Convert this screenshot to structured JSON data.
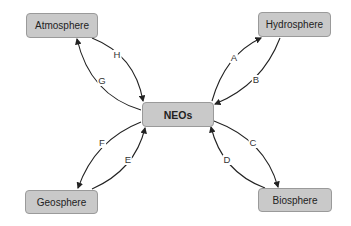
{
  "diagram": {
    "center": {
      "label": "NEOs"
    },
    "nodes": [
      {
        "id": "atmosphere",
        "label": "Atmosphere"
      },
      {
        "id": "hydrosphere",
        "label": "Hydrosphere"
      },
      {
        "id": "geosphere",
        "label": "Geosphere"
      },
      {
        "id": "biosphere",
        "label": "Biosphere"
      }
    ],
    "edges": [
      {
        "label": "A",
        "from": "NEOs",
        "to": "Hydrosphere"
      },
      {
        "label": "B",
        "from": "Hydrosphere",
        "to": "NEOs"
      },
      {
        "label": "C",
        "from": "NEOs",
        "to": "Biosphere"
      },
      {
        "label": "D",
        "from": "Biosphere",
        "to": "NEOs"
      },
      {
        "label": "E",
        "from": "Geosphere",
        "to": "NEOs"
      },
      {
        "label": "F",
        "from": "NEOs",
        "to": "Geosphere"
      },
      {
        "label": "G",
        "from": "NEOs",
        "to": "Atmosphere"
      },
      {
        "label": "H",
        "from": "Atmosphere",
        "to": "NEOs"
      }
    ],
    "colors": {
      "box_fill": "#c9c9c9",
      "box_border": "#9a9a9a",
      "arrow": "#222222"
    }
  }
}
